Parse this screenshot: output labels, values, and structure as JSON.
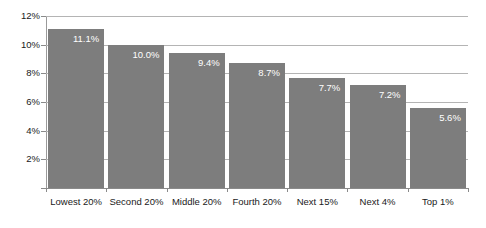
{
  "chart_data": {
    "type": "bar",
    "title": "",
    "subtitle": "",
    "xlabel": "",
    "ylabel": "",
    "categories": [
      "Lowest 20%",
      "Second 20%",
      "Middle 20%",
      "Fourth 20%",
      "Next 15%",
      "Next 4%",
      "Top 1%"
    ],
    "values": [
      11.1,
      10.0,
      9.4,
      8.7,
      7.7,
      7.2,
      5.6
    ],
    "value_labels": [
      "11.1%",
      "10.0%",
      "9.4%",
      "8.7%",
      "7.7%",
      "7.2%",
      "5.6%"
    ],
    "ylim": [
      0,
      12
    ],
    "ytick_values": [
      0,
      2,
      4,
      6,
      8,
      10,
      12
    ],
    "ytick_labels": [
      "",
      "2%",
      "4%",
      "6%",
      "8%",
      "10%",
      "12%"
    ],
    "grid": true,
    "grid_axis": "y",
    "legend": false,
    "legend_position": "none",
    "series": [
      {
        "name": "",
        "values": [
          11.1,
          10.0,
          9.4,
          8.7,
          7.7,
          7.2,
          5.6
        ],
        "color": "#7d7d7d"
      }
    ],
    "colors": {
      "bar": "#7d7d7d",
      "gridline": "#b4b4b4",
      "axis": "#8a8a8a",
      "value_label": "#ffffff",
      "tick_label": "#1a1a1a",
      "background": "#ffffff"
    }
  }
}
